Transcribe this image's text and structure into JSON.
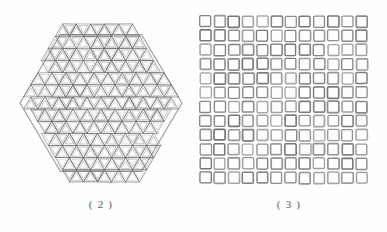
{
  "document": {
    "kind": "scanned-figure-plate",
    "background_color": "#fefefe",
    "ink_color": "#555555"
  },
  "figures": [
    {
      "id": "hexagon-honeycomb",
      "caption": "( 2 )",
      "caption_number": "2",
      "description_name": "hexagonal-triangular-lattice-panel",
      "shape": "hexagon",
      "cell_type": "triangle",
      "orientation": "flat-top",
      "lattice_rows": 13,
      "cells_across_middle": 13,
      "bounds": {
        "x": 20,
        "y": 24,
        "width": 162,
        "height": 158
      },
      "stroke_color": "#6b6b6b",
      "stroke_width": 0.7
    },
    {
      "id": "square-grid",
      "caption": "( 3 )",
      "caption_number": "3",
      "description_name": "square-cell-grid-panel",
      "shape": "rectangle",
      "cell_type": "square",
      "columns": 12,
      "rows": 12,
      "cell_count": 144,
      "cell_size_px": 11,
      "cell_pitch_px": 14.2,
      "bounds": {
        "x": 200,
        "y": 16,
        "width": 172,
        "height": 172
      },
      "stroke_color": "#6a6a6a",
      "stroke_width": 1.5
    }
  ],
  "captions": {
    "left": "( 2 )",
    "right": "( 3 )"
  }
}
